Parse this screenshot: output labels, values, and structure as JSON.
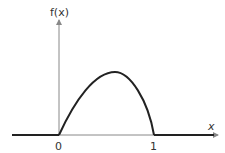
{
  "diagram": {
    "y_axis_label": "f(x)",
    "x_axis_label": "x",
    "tick_labels": [
      "0",
      "1"
    ],
    "curve_description": "f(x) rises from 0 at x=0 to a maximum near x≈0.6, then falls steeply back to 0 at x=1; zero elsewhere",
    "colors": {
      "axis": "#888888",
      "curve": "#222222",
      "text": "#333333"
    }
  }
}
